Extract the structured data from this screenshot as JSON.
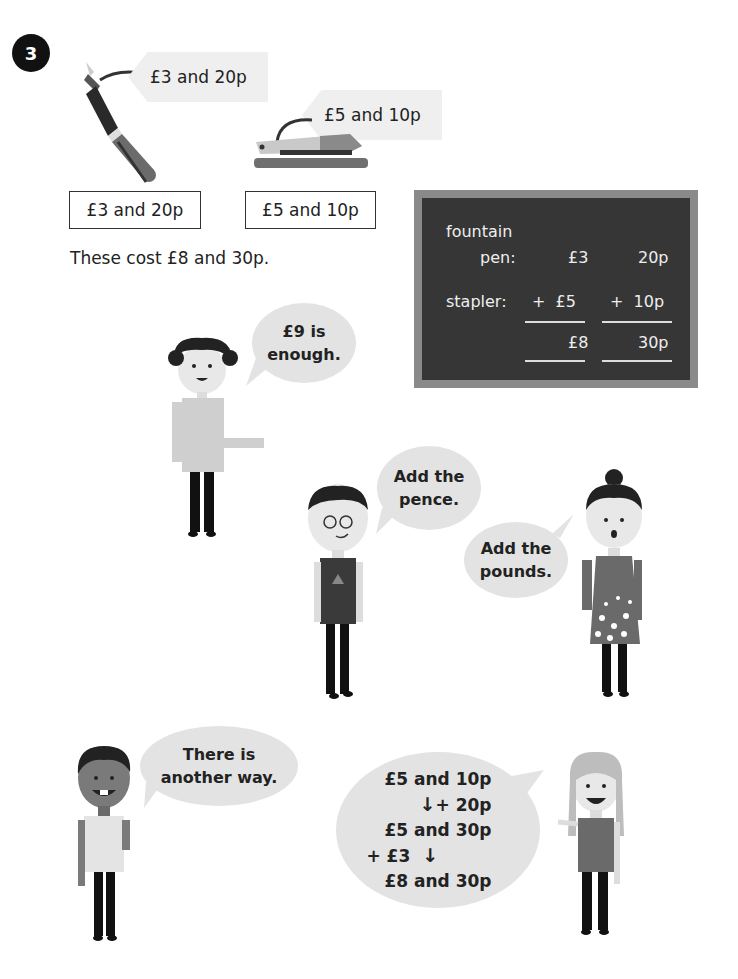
{
  "question_number": "3",
  "items": [
    {
      "name": "fountain pen",
      "tag_label": "£3 and 20p",
      "box_label": "£3 and 20p"
    },
    {
      "name": "stapler",
      "tag_label": "£5 and 10p",
      "box_label": "£5 and 10p"
    }
  ],
  "caption": "These cost £8 and 30p.",
  "chalkboard": {
    "row1_label_line1": "fountain",
    "row1_label_line2": "pen:",
    "row1_pounds": "£3",
    "row1_pence": "20p",
    "row2_label": "stapler:",
    "row2_pounds": "+  £5",
    "row2_pence": "+  10p",
    "total_pounds": "£8",
    "total_pence": "30p"
  },
  "speech": {
    "curly_boy": {
      "line1": "£9 is",
      "line2": "enough."
    },
    "glasses_boy": {
      "line1": "Add the",
      "line2": "pence."
    },
    "bun_girl": {
      "line1": "Add the",
      "line2": "pounds."
    },
    "dark_boy": {
      "line1": "There is",
      "line2": "another way."
    },
    "blonde_girl": {
      "line1": "£5 and 10p",
      "step1": "+ 20p",
      "line2": "£5 and 30p",
      "step2": "+ £3",
      "line3": "£8 and 30p"
    }
  },
  "colors": {
    "badge": "#111111",
    "chalkboard": "#363636",
    "chalkboard_frame": "#8a8a8a",
    "bubble": "#e3e3e3",
    "tag": "#efefef"
  }
}
